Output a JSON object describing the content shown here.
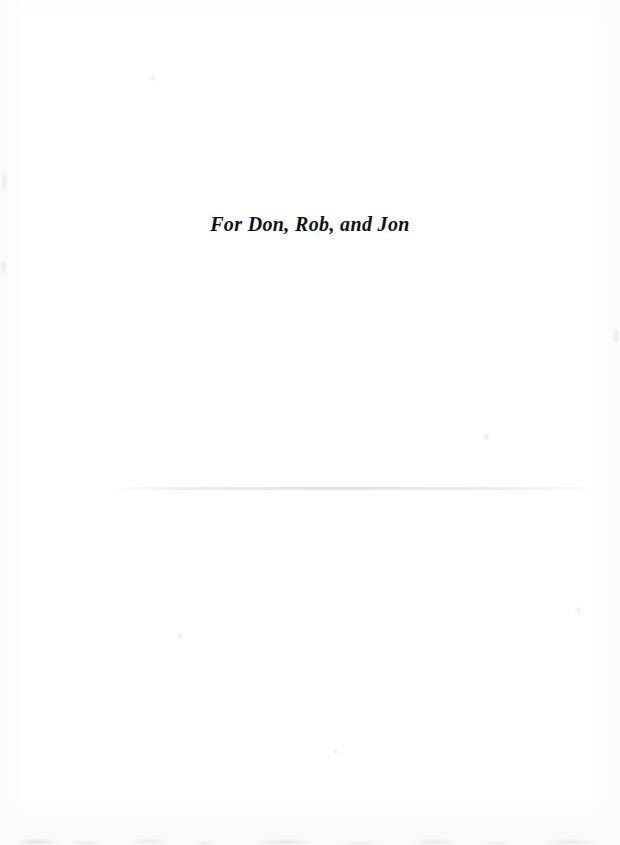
{
  "page": {
    "kind": "book-dedication-page",
    "background_color": "#fefefe",
    "ink_color": "#111114"
  },
  "dedication": {
    "text": "For Don, Rob, and Jon"
  },
  "artifacts": {
    "scan_streak_label": "",
    "bottom_edge_noise_label": "",
    "speck_label": ""
  }
}
